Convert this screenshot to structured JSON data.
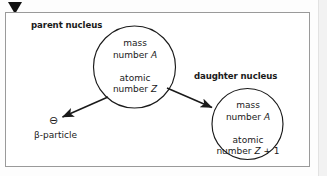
{
  "figure": {
    "marker_icon": "solid-down-triangle",
    "background_color": "#ffffff",
    "border_color": "#9a9a9a",
    "stroke_color": "#1a1a1a"
  },
  "captions": {
    "parent": "parent nucleus",
    "daughter": "daughter nucleus"
  },
  "parent_nucleus": {
    "line1": "mass",
    "line2_prefix": "number ",
    "line2_symbol": "A",
    "line3": "atomic",
    "line4_prefix": "number ",
    "line4_symbol": "Z"
  },
  "daughter_nucleus": {
    "line1": "mass",
    "line2_prefix": "number ",
    "line2_symbol": "A",
    "line3": "atomic",
    "line4_prefix": "number ",
    "line4_symbol": "Z",
    "line4_suffix": " + 1"
  },
  "beta_particle": {
    "charge_symbol": "⊖",
    "label": "β-particle"
  },
  "arrows": [
    {
      "name": "arrow-to-beta-particle",
      "from": "parent nucleus",
      "to": "β-particle"
    },
    {
      "name": "arrow-to-daughter-nucleus",
      "from": "parent nucleus",
      "to": "daughter nucleus"
    }
  ]
}
